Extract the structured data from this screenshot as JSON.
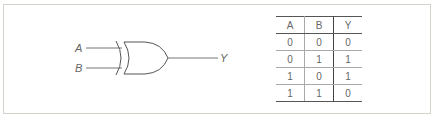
{
  "diagram": {
    "gate_type": "XOR",
    "inputs": [
      {
        "label": "A"
      },
      {
        "label": "B"
      }
    ],
    "output": {
      "label": "Y"
    }
  },
  "truth_table": {
    "headers": [
      "A",
      "B",
      "Y"
    ],
    "rows": [
      [
        "0",
        "0",
        "0"
      ],
      [
        "0",
        "1",
        "1"
      ],
      [
        "1",
        "0",
        "1"
      ],
      [
        "1",
        "1",
        "0"
      ]
    ]
  }
}
